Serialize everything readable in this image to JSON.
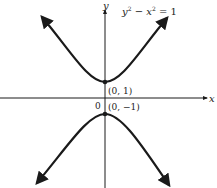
{
  "figure": {
    "equation": "y² − x² = 1",
    "equation_parts": {
      "y": "y",
      "sup1": "2",
      "minus": " − ",
      "x": "x",
      "sup2": "2",
      "equals": " = 1"
    },
    "axes": {
      "x_label": "x",
      "y_label": "y",
      "origin_label": "0"
    },
    "points": [
      {
        "label": "(0, 1)",
        "x": 0,
        "y": 1
      },
      {
        "label": "(0, −1)",
        "x": 0,
        "y": -1
      }
    ],
    "curve": "hyperbola",
    "branches": [
      "upper",
      "lower"
    ],
    "colors": {
      "stroke": "#1a1a1a",
      "background": "#ffffff"
    }
  }
}
